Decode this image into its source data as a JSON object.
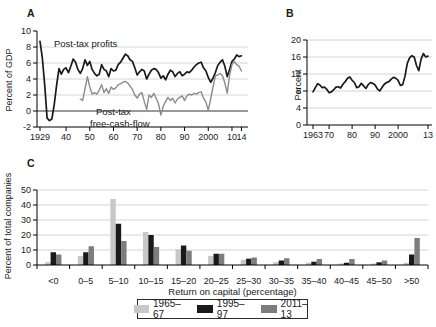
{
  "figure": {
    "panels": {
      "A": {
        "label": "A",
        "ylabel": "Percent of GDP",
        "annotations": {
          "profits": "Post-tax profits",
          "fcf1": "Post-tax",
          "fcf2": "free-cash-flow"
        },
        "yticks": [
          {
            "v": -2,
            "l": "-2"
          },
          {
            "v": 0,
            "l": "0"
          },
          {
            "v": 2,
            "l": "2"
          },
          {
            "v": 4,
            "l": "4"
          },
          {
            "v": 6,
            "l": "6"
          },
          {
            "v": 8,
            "l": "8"
          },
          {
            "v": 10,
            "l": "10"
          }
        ],
        "xticks": [
          {
            "v": 1929,
            "l": "1929"
          },
          {
            "v": 1940,
            "l": "40"
          },
          {
            "v": 1950,
            "l": "50"
          },
          {
            "v": 1960,
            "l": "60"
          },
          {
            "v": 1970,
            "l": "70"
          },
          {
            "v": 1980,
            "l": "80"
          },
          {
            "v": 1990,
            "l": "90"
          },
          {
            "v": 2000,
            "l": "2000"
          },
          {
            "v": 2010,
            "l": "10"
          },
          {
            "v": 2014,
            "l": "14"
          }
        ]
      },
      "B": {
        "label": "B",
        "ylabel": "Percent",
        "yticks": [
          {
            "v": 0,
            "l": "0"
          },
          {
            "v": 4,
            "l": "4"
          },
          {
            "v": 8,
            "l": "8"
          },
          {
            "v": 12,
            "l": "12"
          },
          {
            "v": 16,
            "l": "16"
          },
          {
            "v": 20,
            "l": "20"
          }
        ],
        "xticks": [
          {
            "v": 1963,
            "l": "1963"
          },
          {
            "v": 1970,
            "l": "70"
          },
          {
            "v": 1980,
            "l": "80"
          },
          {
            "v": 1990,
            "l": "90"
          },
          {
            "v": 2000,
            "l": "2000"
          },
          {
            "v": 2013,
            "l": "13"
          }
        ]
      },
      "C": {
        "label": "C",
        "ylabel": "Percent of total companies",
        "xlabel": "Return on capital (percentage)",
        "yticks": [
          {
            "v": 0,
            "l": "0"
          },
          {
            "v": 10,
            "l": "10"
          },
          {
            "v": 20,
            "l": "20"
          },
          {
            "v": 30,
            "l": "30"
          },
          {
            "v": 40,
            "l": "40"
          },
          {
            "v": 50,
            "l": "50"
          }
        ]
      }
    },
    "legend": {
      "items": [
        {
          "label": "1965–67",
          "color": "#c8c8c8"
        },
        {
          "label": "1995–97",
          "color": "#1a1a1a"
        },
        {
          "label": "2011–13",
          "color": "#7d7d7d"
        }
      ]
    },
    "colors": {
      "axis": "#000000",
      "gridline": "#d4d4d4",
      "zero_line": "#333333",
      "text": "#1a1a1a"
    }
  },
  "chart_data": [
    {
      "type": "line",
      "panel": "A",
      "ylabel": "Percent of GDP",
      "xlim": [
        1929,
        2014
      ],
      "ylim": [
        -2,
        10
      ],
      "grid": "horizontal",
      "series": [
        {
          "name": "Post-tax profits",
          "color": "#1a1a1a",
          "points": [
            [
              1929,
              8.7
            ],
            [
              1930,
              6.6
            ],
            [
              1931,
              3.2
            ],
            [
              1932,
              -0.9
            ],
            [
              1933,
              -1.2
            ],
            [
              1934,
              -1.0
            ],
            [
              1935,
              0.8
            ],
            [
              1936,
              3.2
            ],
            [
              1937,
              5.3
            ],
            [
              1938,
              4.6
            ],
            [
              1939,
              5.2
            ],
            [
              1940,
              5.4
            ],
            [
              1941,
              4.8
            ],
            [
              1942,
              5.6
            ],
            [
              1943,
              6.5
            ],
            [
              1944,
              6.1
            ],
            [
              1945,
              5.2
            ],
            [
              1946,
              4.7
            ],
            [
              1947,
              5.3
            ],
            [
              1948,
              6.4
            ],
            [
              1949,
              5.7
            ],
            [
              1950,
              6.2
            ],
            [
              1951,
              5.2
            ],
            [
              1952,
              4.7
            ],
            [
              1953,
              4.4
            ],
            [
              1954,
              4.6
            ],
            [
              1955,
              5.8
            ],
            [
              1956,
              5.2
            ],
            [
              1957,
              5.0
            ],
            [
              1958,
              4.3
            ],
            [
              1959,
              5.3
            ],
            [
              1960,
              5.0
            ],
            [
              1961,
              5.1
            ],
            [
              1962,
              5.8
            ],
            [
              1963,
              6.1
            ],
            [
              1964,
              6.6
            ],
            [
              1965,
              7.1
            ],
            [
              1966,
              6.9
            ],
            [
              1967,
              6.4
            ],
            [
              1968,
              6.2
            ],
            [
              1969,
              5.4
            ],
            [
              1970,
              4.5
            ],
            [
              1971,
              4.9
            ],
            [
              1972,
              5.2
            ],
            [
              1973,
              5.0
            ],
            [
              1974,
              4.0
            ],
            [
              1975,
              4.6
            ],
            [
              1976,
              5.1
            ],
            [
              1977,
              5.3
            ],
            [
              1978,
              5.2
            ],
            [
              1979,
              4.8
            ],
            [
              1980,
              4.1
            ],
            [
              1981,
              4.4
            ],
            [
              1982,
              3.9
            ],
            [
              1983,
              4.6
            ],
            [
              1984,
              5.1
            ],
            [
              1985,
              4.9
            ],
            [
              1986,
              4.3
            ],
            [
              1987,
              4.7
            ],
            [
              1988,
              4.9
            ],
            [
              1989,
              4.4
            ],
            [
              1990,
              4.6
            ],
            [
              1991,
              4.9
            ],
            [
              1992,
              4.8
            ],
            [
              1993,
              5.1
            ],
            [
              1994,
              5.5
            ],
            [
              1995,
              5.8
            ],
            [
              1996,
              6.0
            ],
            [
              1997,
              6.1
            ],
            [
              1998,
              5.4
            ],
            [
              1999,
              5.0
            ],
            [
              2000,
              4.2
            ],
            [
              2001,
              3.6
            ],
            [
              2002,
              4.1
            ],
            [
              2003,
              4.8
            ],
            [
              2004,
              5.7
            ],
            [
              2005,
              6.1
            ],
            [
              2006,
              6.4
            ],
            [
              2007,
              5.6
            ],
            [
              2008,
              4.3
            ],
            [
              2009,
              5.2
            ],
            [
              2010,
              6.2
            ],
            [
              2011,
              6.5
            ],
            [
              2012,
              7.0
            ],
            [
              2013,
              6.8
            ],
            [
              2014,
              6.9
            ]
          ]
        },
        {
          "name": "Post-tax free-cash-flow",
          "color": "#8c8c8c",
          "points": [
            [
              1946,
              1.5
            ],
            [
              1947,
              1.3
            ],
            [
              1948,
              2.8
            ],
            [
              1949,
              4.3
            ],
            [
              1950,
              3.0
            ],
            [
              1951,
              2.1
            ],
            [
              1952,
              2.3
            ],
            [
              1953,
              2.1
            ],
            [
              1954,
              2.6
            ],
            [
              1955,
              3.3
            ],
            [
              1956,
              2.3
            ],
            [
              1957,
              2.8
            ],
            [
              1958,
              2.2
            ],
            [
              1959,
              3.0
            ],
            [
              1960,
              2.7
            ],
            [
              1961,
              2.9
            ],
            [
              1962,
              3.3
            ],
            [
              1963,
              3.4
            ],
            [
              1964,
              3.6
            ],
            [
              1965,
              3.7
            ],
            [
              1966,
              3.5
            ],
            [
              1967,
              3.1
            ],
            [
              1968,
              2.7
            ],
            [
              1969,
              2.0
            ],
            [
              1970,
              1.6
            ],
            [
              1971,
              2.1
            ],
            [
              1972,
              2.3
            ],
            [
              1973,
              1.2
            ],
            [
              1974,
              0.2
            ],
            [
              1975,
              2.0
            ],
            [
              1976,
              1.7
            ],
            [
              1977,
              2.2
            ],
            [
              1978,
              1.6
            ],
            [
              1979,
              0.9
            ],
            [
              1980,
              -0.5
            ],
            [
              1981,
              0.6
            ],
            [
              1982,
              1.2
            ],
            [
              1983,
              1.7
            ],
            [
              1984,
              1.3
            ],
            [
              1985,
              1.6
            ],
            [
              1986,
              1.0
            ],
            [
              1987,
              1.5
            ],
            [
              1988,
              1.7
            ],
            [
              1989,
              1.9
            ],
            [
              1990,
              1.3
            ],
            [
              1991,
              1.9
            ],
            [
              1992,
              2.1
            ],
            [
              1993,
              2.0
            ],
            [
              1994,
              2.2
            ],
            [
              1995,
              2.1
            ],
            [
              1996,
              2.3
            ],
            [
              1997,
              2.4
            ],
            [
              1998,
              1.6
            ],
            [
              1999,
              1.1
            ],
            [
              2000,
              0.1
            ],
            [
              2001,
              1.5
            ],
            [
              2002,
              3.0
            ],
            [
              2003,
              4.4
            ],
            [
              2004,
              4.5
            ],
            [
              2005,
              4.7
            ],
            [
              2006,
              4.4
            ],
            [
              2007,
              3.5
            ],
            [
              2008,
              2.2
            ],
            [
              2009,
              4.5
            ],
            [
              2010,
              5.8
            ],
            [
              2011,
              6.2
            ],
            [
              2012,
              5.8
            ],
            [
              2013,
              5.6
            ],
            [
              2014,
              5.0
            ]
          ]
        }
      ]
    },
    {
      "type": "line",
      "panel": "B",
      "ylabel": "Percent",
      "xlim": [
        1963,
        2013
      ],
      "ylim": [
        0,
        20
      ],
      "grid": "horizontal",
      "series": [
        {
          "name": "Percent",
          "color": "#1a1a1a",
          "points": [
            [
              1963,
              7.8
            ],
            [
              1964,
              8.8
            ],
            [
              1965,
              9.7
            ],
            [
              1966,
              9.4
            ],
            [
              1967,
              8.8
            ],
            [
              1968,
              8.9
            ],
            [
              1969,
              8.4
            ],
            [
              1970,
              7.6
            ],
            [
              1971,
              7.8
            ],
            [
              1972,
              8.3
            ],
            [
              1973,
              8.9
            ],
            [
              1974,
              9.0
            ],
            [
              1975,
              8.7
            ],
            [
              1976,
              9.6
            ],
            [
              1977,
              10.2
            ],
            [
              1978,
              11.0
            ],
            [
              1979,
              11.3
            ],
            [
              1980,
              10.5
            ],
            [
              1981,
              10.0
            ],
            [
              1982,
              8.8
            ],
            [
              1983,
              9.0
            ],
            [
              1984,
              9.8
            ],
            [
              1985,
              9.2
            ],
            [
              1986,
              8.6
            ],
            [
              1987,
              9.5
            ],
            [
              1988,
              10.0
            ],
            [
              1989,
              9.8
            ],
            [
              1990,
              9.4
            ],
            [
              1991,
              8.5
            ],
            [
              1992,
              8.0
            ],
            [
              1993,
              8.8
            ],
            [
              1994,
              9.6
            ],
            [
              1995,
              10.0
            ],
            [
              1996,
              10.2
            ],
            [
              1997,
              10.8
            ],
            [
              1998,
              11.2
            ],
            [
              1999,
              11.0
            ],
            [
              2000,
              10.5
            ],
            [
              2001,
              9.3
            ],
            [
              2002,
              9.5
            ],
            [
              2003,
              11.5
            ],
            [
              2004,
              14.5
            ],
            [
              2005,
              15.8
            ],
            [
              2006,
              16.3
            ],
            [
              2007,
              16.0
            ],
            [
              2008,
              14.0
            ],
            [
              2009,
              12.8
            ],
            [
              2010,
              15.5
            ],
            [
              2011,
              16.8
            ],
            [
              2012,
              16.0
            ],
            [
              2013,
              16.2
            ]
          ]
        }
      ]
    },
    {
      "type": "bar",
      "panel": "C",
      "title": "",
      "xlabel": "Return on capital (percentage)",
      "ylabel": "Percent of total companies",
      "ylim": [
        0,
        50
      ],
      "grid": "horizontal",
      "legend_position": "bottom",
      "categories": [
        "<0",
        "0–5",
        "5–10",
        "10–15",
        "15–20",
        "20–25",
        "25–30",
        "30–35",
        "35–40",
        "40–45",
        "45–50",
        ">50"
      ],
      "series": [
        {
          "name": "1965–67",
          "color": "#c8c8c8",
          "values": [
            2,
            6,
            44,
            22,
            10.5,
            6,
            3.5,
            2,
            1.5,
            1,
            1,
            1.5
          ]
        },
        {
          "name": "1995–97",
          "color": "#1a1a1a",
          "values": [
            8.5,
            8.5,
            27.5,
            20,
            13,
            7.5,
            4.2,
            3,
            2.2,
            1.5,
            1.8,
            7
          ]
        },
        {
          "name": "2011–13",
          "color": "#7d7d7d",
          "values": [
            7,
            12.5,
            16,
            12,
            9.5,
            7.5,
            5,
            4.5,
            4,
            4,
            3,
            18
          ]
        }
      ]
    }
  ]
}
